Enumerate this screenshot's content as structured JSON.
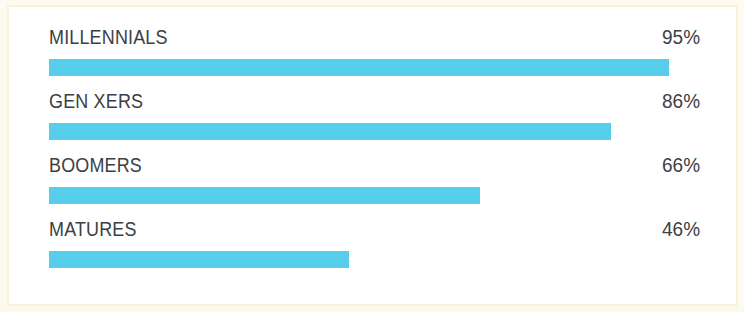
{
  "figure": {
    "background_color": "#ffffff",
    "frame_color": "#f7f2d8",
    "bar_color": "#57cdec",
    "text_color": "#3b4046"
  },
  "chart_data": {
    "type": "bar",
    "orientation": "horizontal",
    "title": "",
    "subtitle": "",
    "xlabel": "",
    "ylabel": "",
    "xlim": [
      0,
      100
    ],
    "grid": false,
    "legend": false,
    "value_suffix": "%",
    "categories": [
      "MILLENNIALS",
      "GEN XERS",
      "BOOMERS",
      "MATURES"
    ],
    "values": [
      95,
      86,
      66,
      46
    ],
    "value_labels": [
      "95%",
      "86%",
      "66%",
      "46%"
    ],
    "bars": [
      {
        "label": "MILLENNIALS",
        "value": 95,
        "value_label": "95%",
        "color": "#57cdec"
      },
      {
        "label": "GEN XERS",
        "value": 86,
        "value_label": "86%",
        "color": "#57cdec"
      },
      {
        "label": "BOOMERS",
        "value": 66,
        "value_label": "66%",
        "color": "#57cdec"
      },
      {
        "label": "MATURES",
        "value": 46,
        "value_label": "46%",
        "color": "#57cdec"
      }
    ]
  }
}
